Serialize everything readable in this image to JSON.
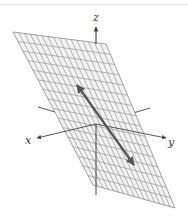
{
  "figure": {
    "axes": {
      "x_label": "x",
      "y_label": "y",
      "z_label": "z"
    },
    "plane": {
      "corners": [
        [
          13,
          32
        ],
        [
          106,
          44
        ],
        [
          175,
          208
        ],
        [
          93,
          185
        ]
      ],
      "grid_divisions_u": 16,
      "grid_divisions_v": 16,
      "fill": "#f2f2f2",
      "grid_color": "#8a8a8a"
    },
    "vector": {
      "from": [
        134,
        165
      ],
      "to": [
        77,
        85
      ],
      "color": "#555555",
      "double_headed": true
    },
    "origin": [
      96,
      124
    ],
    "colors": {
      "axis": "#444444",
      "border_line": "#e2e2e2"
    }
  }
}
